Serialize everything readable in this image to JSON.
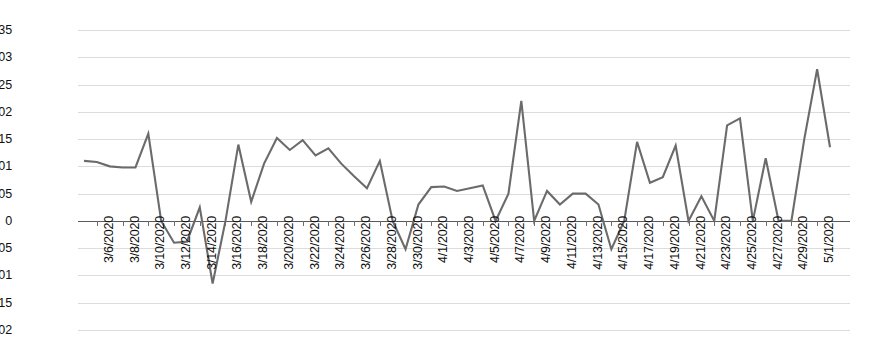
{
  "chart_data": {
    "type": "line",
    "title": "",
    "subtitle": "",
    "xlabel": "",
    "ylabel": "",
    "grid": true,
    "legend": false,
    "legend_position": "none",
    "line_color": "#6b6b6b",
    "background_color": "#ffffff",
    "gridline_color": "#dcdcdc",
    "axis_color": "#5a5a5a",
    "ylim": [
      -0.02,
      0.035
    ],
    "ytick_step": 0.005,
    "ytick_labels": [
      "0.035",
      "0.03",
      "0.025",
      "0.02",
      "0.015",
      "0.01",
      "0.005",
      "0",
      "-0.005",
      "-0.01",
      "-0.015",
      "-0.02"
    ],
    "ytick_values": [
      0.035,
      0.03,
      0.025,
      0.02,
      0.015,
      0.01,
      0.005,
      0,
      -0.005,
      -0.01,
      -0.015,
      -0.02
    ],
    "xtick_labels": [
      "3/6/2020",
      "3/8/2020",
      "3/10/2020",
      "3/12/2020",
      "3/14/2020",
      "3/16/2020",
      "3/18/2020",
      "3/20/2020",
      "3/22/2020",
      "3/24/2020",
      "3/26/2020",
      "3/28/2020",
      "3/30/2020",
      "4/1/2020",
      "4/3/2020",
      "4/5/2020",
      "4/7/2020",
      "4/9/2020",
      "4/11/2020",
      "4/13/2020",
      "4/15/2020",
      "4/17/2020",
      "4/19/2020",
      "4/21/2020",
      "4/23/2020",
      "4/25/2020",
      "4/27/2020",
      "4/29/2020",
      "5/1/2020"
    ],
    "xtick_label_every": 2,
    "xtick_label_start_index": 1,
    "x": [
      "3/5/2020",
      "3/6/2020",
      "3/7/2020",
      "3/8/2020",
      "3/9/2020",
      "3/10/2020",
      "3/11/2020",
      "3/12/2020",
      "3/13/2020",
      "3/14/2020",
      "3/15/2020",
      "3/16/2020",
      "3/17/2020",
      "3/18/2020",
      "3/19/2020",
      "3/20/2020",
      "3/21/2020",
      "3/22/2020",
      "3/23/2020",
      "3/24/2020",
      "3/25/2020",
      "3/26/2020",
      "3/27/2020",
      "3/28/2020",
      "3/29/2020",
      "3/30/2020",
      "3/31/2020",
      "4/1/2020",
      "4/2/2020",
      "4/3/2020",
      "4/4/2020",
      "4/5/2020",
      "4/6/2020",
      "4/7/2020",
      "4/8/2020",
      "4/9/2020",
      "4/10/2020",
      "4/11/2020",
      "4/12/2020",
      "4/13/2020",
      "4/14/2020",
      "4/15/2020",
      "4/16/2020",
      "4/17/2020",
      "4/18/2020",
      "4/19/2020",
      "4/20/2020",
      "4/21/2020",
      "4/22/2020",
      "4/23/2020",
      "4/24/2020",
      "4/25/2020",
      "4/26/2020",
      "4/27/2020",
      "4/28/2020",
      "4/29/2020",
      "4/30/2020",
      "5/1/2020",
      "5/2/2020"
    ],
    "values": [
      0.011,
      0.0108,
      0.01,
      0.0098,
      0.0098,
      0.016,
      0.0,
      -0.004,
      -0.0038,
      0.0025,
      -0.0115,
      0.0,
      0.014,
      0.0035,
      0.0105,
      0.0152,
      0.013,
      0.0148,
      0.012,
      0.0133,
      0.0105,
      0.0082,
      0.006,
      0.011,
      0.0,
      -0.0052,
      0.003,
      0.0062,
      0.0063,
      0.0055,
      0.006,
      0.0065,
      0.0,
      0.005,
      0.022,
      0.0,
      0.0055,
      0.003,
      0.005,
      0.005,
      0.003,
      -0.0052,
      0.0,
      0.0145,
      0.007,
      0.008,
      0.0138,
      0.0,
      0.0045,
      0.0,
      0.0175,
      0.0188,
      0.0,
      0.0115,
      0.0,
      0.0,
      0.015,
      0.0278,
      0.0135
    ],
    "series": [
      {
        "name": "series-1",
        "values": [
          0.011,
          0.0108,
          0.01,
          0.0098,
          0.0098,
          0.016,
          0.0,
          -0.004,
          -0.0038,
          0.0025,
          -0.0115,
          0.0,
          0.014,
          0.0035,
          0.0105,
          0.0152,
          0.013,
          0.0148,
          0.012,
          0.0133,
          0.0105,
          0.0082,
          0.006,
          0.011,
          0.0,
          -0.0052,
          0.003,
          0.0062,
          0.0063,
          0.0055,
          0.006,
          0.0065,
          0.0,
          0.005,
          0.022,
          0.0,
          0.0055,
          0.003,
          0.005,
          0.005,
          0.003,
          -0.0052,
          0.0,
          0.0145,
          0.007,
          0.008,
          0.0138,
          0.0,
          0.0045,
          0.0,
          0.0175,
          0.0188,
          0.0,
          0.0115,
          0.0,
          0.0,
          0.015,
          0.0278,
          0.0135
        ]
      }
    ]
  }
}
